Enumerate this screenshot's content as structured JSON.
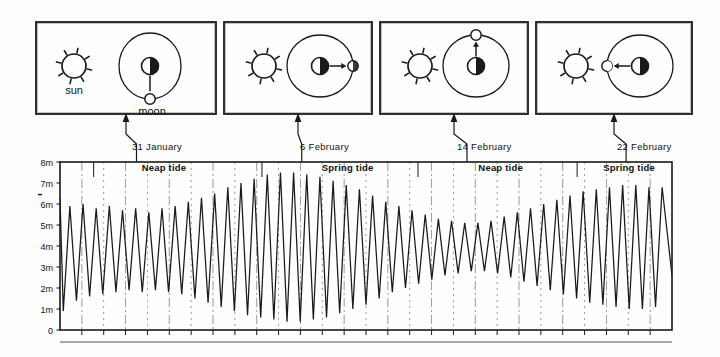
{
  "figure": {
    "ink_color": "#1a1a1a",
    "background_color": "#fefefe"
  },
  "panels": [
    {
      "id": "panel-1",
      "sun_label": "sun",
      "moon_label": "moon",
      "moon_position": "below",
      "phase": "quarter",
      "tide_type": "Neap tide",
      "date": "31 January"
    },
    {
      "id": "panel-2",
      "sun_label": "",
      "moon_label": "",
      "moon_position": "right",
      "phase": "full",
      "tide_type": "Spring tide",
      "date": "6 February"
    },
    {
      "id": "panel-3",
      "sun_label": "",
      "moon_label": "",
      "moon_position": "above",
      "phase": "quarter",
      "tide_type": "Neap tide",
      "date": "14 February"
    },
    {
      "id": "panel-4",
      "sun_label": "",
      "moon_label": "",
      "moon_position": "left",
      "phase": "new",
      "tide_type": "Spring tide",
      "date": "22 February"
    }
  ],
  "date_labels": [
    "31 January",
    "6 February",
    "14 February",
    "22 February"
  ],
  "tide_region_labels": [
    "Neap tide",
    "Spring tide",
    "Neap tide",
    "Spring tide"
  ],
  "chart_data": {
    "type": "line",
    "xlabel": "",
    "ylabel": "",
    "ylim": [
      0,
      8
    ],
    "grid": true,
    "legend_position": "none",
    "ytick_labels": [
      "8m",
      "7m",
      "6m",
      "5m",
      "4m",
      "3m",
      "2m",
      "1m",
      "0"
    ],
    "ytick_values": [
      8,
      7,
      6,
      5,
      4,
      3,
      2,
      1,
      0
    ],
    "annotations": [
      {
        "text": "Neap tide",
        "x_fraction": 0.17,
        "y": 7.7
      },
      {
        "text": "Spring tide",
        "x_fraction": 0.47,
        "y": 7.7
      },
      {
        "text": "Neap tide",
        "x_fraction": 0.72,
        "y": 7.7
      },
      {
        "text": "Spring tide",
        "x_fraction": 0.93,
        "y": 7.7
      }
    ],
    "date_markers": [
      {
        "label": "31 January",
        "x_fraction": 0.125,
        "tide": "Neap tide"
      },
      {
        "label": "6 February",
        "x_fraction": 0.395,
        "tide": "Spring tide"
      },
      {
        "label": "14 February",
        "x_fraction": 0.665,
        "tide": "Neap tide"
      },
      {
        "label": "22 February",
        "x_fraction": 0.925,
        "tide": "Spring tide"
      }
    ],
    "series": [
      {
        "name": "Tide height",
        "description": "Semidiurnal tide with spring-neap amplitude modulation; ~56 tidal cycles over ~28 days",
        "cycles": 56,
        "mean_level": 3.9,
        "amplitude_envelope_peaks": [
          2.1,
          3.6,
          2.0,
          3.3
        ],
        "peak_highs": [
          6.3,
          5.9,
          6.0,
          5.8,
          5.9,
          5.7,
          5.8,
          5.6,
          5.8,
          5.9,
          6.1,
          6.3,
          6.5,
          6.8,
          7.0,
          7.2,
          7.4,
          7.5,
          7.5,
          7.4,
          7.3,
          7.1,
          6.9,
          6.7,
          6.4,
          6.1,
          5.9,
          5.7,
          5.5,
          5.3,
          5.2,
          5.1,
          5.1,
          5.2,
          5.4,
          5.6,
          5.8,
          6.0,
          6.2,
          6.4,
          6.6,
          6.7,
          6.8,
          6.9,
          6.9,
          6.8
        ],
        "trough_lows": [
          0.9,
          1.4,
          1.6,
          1.7,
          1.8,
          1.9,
          1.8,
          1.9,
          1.8,
          1.7,
          1.5,
          1.3,
          1.1,
          0.9,
          0.7,
          0.6,
          0.5,
          0.4,
          0.4,
          0.5,
          0.6,
          0.8,
          1.0,
          1.2,
          1.5,
          1.8,
          2.0,
          2.2,
          2.4,
          2.6,
          2.7,
          2.8,
          2.8,
          2.7,
          2.5,
          2.3,
          2.1,
          1.9,
          1.7,
          1.5,
          1.3,
          1.2,
          1.1,
          1.0,
          1.0,
          1.1
        ]
      }
    ]
  }
}
